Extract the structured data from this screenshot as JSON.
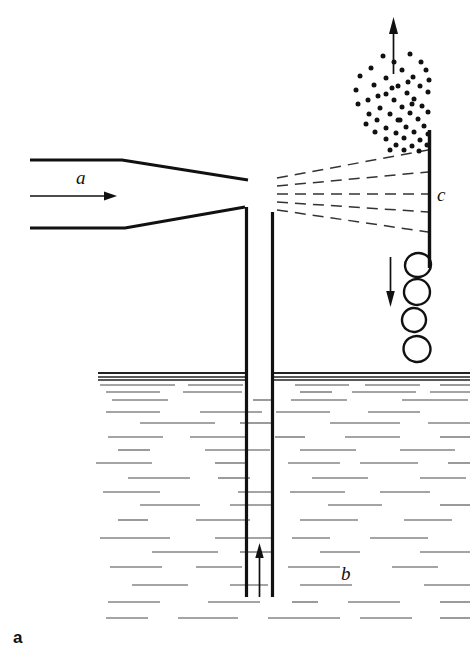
{
  "figure": {
    "caption_label": "a",
    "background_color": "#ffffff",
    "ink_color": "#111111",
    "water_line_color": "#4a4a4a",
    "width": 474,
    "height": 651
  },
  "labels": {
    "inlet": "a",
    "liquid": "b",
    "wall": "c"
  },
  "chart_data": {
    "type": "diagram",
    "title": "",
    "components": [
      {
        "name": "inlet-nozzle",
        "label": "a",
        "role": "converging gas/liquid inlet nozzle at upper left",
        "top_edge": [
          [
            30,
            160
          ],
          [
            122,
            160
          ],
          [
            248,
            180
          ]
        ],
        "bottom_edge": [
          [
            30,
            228
          ],
          [
            125,
            228
          ],
          [
            245,
            207
          ]
        ]
      },
      {
        "name": "inlet-flow-arrow",
        "role": "horizontal arrow indicating inflow direction",
        "from": [
          30,
          196
        ],
        "to": [
          110,
          196
        ]
      },
      {
        "name": "riser-tube",
        "role": "central vertical draft tube",
        "left_wall_x": 246,
        "right_wall_x": 272,
        "top_y_left": 207,
        "top_y_right": 212,
        "bottom_y": 597
      },
      {
        "name": "riser-flow-arrow",
        "role": "upward arrow inside riser tube showing liquid rise",
        "from": [
          259,
          597
        ],
        "to": [
          259,
          545
        ]
      },
      {
        "name": "spray-streaklines",
        "role": "dashed streak lines of the dispersed jet fanning toward the wall",
        "count": 5,
        "origin_x": 277,
        "target_x": 428,
        "origin_ys": [
          178,
          186,
          194,
          202,
          210
        ],
        "target_ys": [
          150,
          172,
          194,
          212,
          232
        ]
      },
      {
        "name": "droplet-spray-cloud",
        "role": "fine droplets / spray above the impingement region",
        "dot_count": 54,
        "bounds": [
          355,
          52,
          432,
          152
        ]
      },
      {
        "name": "exit-gas-arrow",
        "role": "upward arrow showing gas exit at top",
        "from": [
          393,
          72
        ],
        "to": [
          393,
          18
        ]
      },
      {
        "name": "wall-plate",
        "label": "c",
        "role": "vertical impingement wall / baffle on the right",
        "x": 429,
        "from_y": 130,
        "to_y": 268
      },
      {
        "name": "falling-film-arrow",
        "role": "downward arrow showing drainage along the wall",
        "from": [
          390,
          257
        ],
        "to": [
          390,
          306
        ]
      },
      {
        "name": "bubbles",
        "role": "coalesced drops/bubbles descending beside the wall",
        "count": 4,
        "positions": [
          [
            418,
            265
          ],
          [
            417,
            292
          ],
          [
            414,
            320
          ],
          [
            417,
            349
          ]
        ],
        "radii": [
          [
            13,
            12
          ],
          [
            13,
            13
          ],
          [
            12,
            12
          ],
          [
            13,
            13
          ]
        ]
      },
      {
        "name": "liquid-surface",
        "role": "free surface of the liquid pool",
        "line_ys": [
          373,
          377,
          380
        ],
        "from_x": 98,
        "to_x": 470
      },
      {
        "name": "liquid-pool",
        "label": "b",
        "role": "bulk liquid below the free surface, drawn as broken horizontal strokes",
        "top_y": 380,
        "bottom_y": 620
      }
    ],
    "annotations": [
      {
        "text": "a",
        "x": 83,
        "y": 183,
        "style": "italic",
        "refers_to": "inlet-nozzle"
      },
      {
        "text": "c",
        "x": 437,
        "y": 200,
        "style": "italic",
        "refers_to": "wall-plate"
      },
      {
        "text": "b",
        "x": 345,
        "y": 578,
        "style": "italic",
        "refers_to": "liquid-pool"
      },
      {
        "text": "a",
        "x": 14,
        "y": 641,
        "style": "bold-upright",
        "refers_to": "figure-panel-caption"
      }
    ]
  },
  "water_strokes": [
    {
      "y": 385,
      "segs": [
        [
          100,
          175
        ],
        [
          188,
          243
        ],
        [
          295,
          349
        ],
        [
          365,
          420
        ],
        [
          440,
          470
        ]
      ]
    },
    {
      "y": 392,
      "segs": [
        [
          106,
          160
        ],
        [
          183,
          242
        ],
        [
          300,
          332
        ],
        [
          352,
          416
        ],
        [
          430,
          470
        ]
      ]
    },
    {
      "y": 400,
      "segs": [
        [
          112,
          168
        ],
        [
          253,
          272
        ],
        [
          291,
          347
        ],
        [
          402,
          468
        ]
      ]
    },
    {
      "y": 412,
      "segs": [
        [
          106,
          160
        ],
        [
          200,
          262
        ],
        [
          276,
          330
        ],
        [
          368,
          420
        ]
      ]
    },
    {
      "y": 423,
      "segs": [
        [
          140,
          215
        ],
        [
          240,
          271
        ],
        [
          330,
          400
        ],
        [
          428,
          470
        ]
      ]
    },
    {
      "y": 437,
      "segs": [
        [
          108,
          163
        ],
        [
          190,
          248
        ],
        [
          275,
          305
        ],
        [
          345,
          400
        ],
        [
          440,
          470
        ]
      ]
    },
    {
      "y": 450,
      "segs": [
        [
          118,
          150
        ],
        [
          205,
          270
        ],
        [
          300,
          356
        ],
        [
          400,
          455
        ]
      ]
    },
    {
      "y": 463,
      "segs": [
        [
          96,
          152
        ],
        [
          215,
          245
        ],
        [
          288,
          340
        ],
        [
          360,
          418
        ],
        [
          448,
          470
        ]
      ]
    },
    {
      "y": 478,
      "segs": [
        [
          128,
          190
        ],
        [
          218,
          250
        ],
        [
          312,
          368
        ],
        [
          420,
          466
        ]
      ]
    },
    {
      "y": 492,
      "segs": [
        [
          103,
          160
        ],
        [
          238,
          272
        ],
        [
          290,
          345
        ],
        [
          380,
          430
        ]
      ]
    },
    {
      "y": 505,
      "segs": [
        [
          140,
          200
        ],
        [
          230,
          271
        ],
        [
          328,
          382
        ],
        [
          440,
          470
        ]
      ]
    },
    {
      "y": 520,
      "segs": [
        [
          118,
          148
        ],
        [
          196,
          250
        ],
        [
          300,
          358
        ],
        [
          404,
          452
        ]
      ]
    },
    {
      "y": 538,
      "segs": [
        [
          100,
          170
        ],
        [
          215,
          272
        ],
        [
          292,
          330
        ],
        [
          370,
          428
        ]
      ]
    },
    {
      "y": 552,
      "segs": [
        [
          152,
          218
        ],
        [
          240,
          271
        ],
        [
          320,
          360
        ],
        [
          420,
          470
        ]
      ]
    },
    {
      "y": 567,
      "segs": [
        [
          110,
          162
        ],
        [
          196,
          242
        ],
        [
          288,
          340
        ],
        [
          392,
          438
        ]
      ]
    },
    {
      "y": 585,
      "segs": [
        [
          132,
          188
        ],
        [
          230,
          268
        ],
        [
          300,
          352
        ],
        [
          424,
          470
        ]
      ]
    },
    {
      "y": 602,
      "segs": [
        [
          108,
          160
        ],
        [
          208,
          260
        ],
        [
          292,
          318
        ],
        [
          348,
          400
        ],
        [
          440,
          470
        ]
      ]
    },
    {
      "y": 618,
      "segs": [
        [
          106,
          148
        ],
        [
          178,
          238
        ],
        [
          268,
          340
        ],
        [
          360,
          412
        ],
        [
          440,
          470
        ]
      ]
    }
  ],
  "spray_dots": [
    [
      383,
      56
    ],
    [
      410,
      54
    ],
    [
      394,
      62
    ],
    [
      421,
      62
    ],
    [
      371,
      68
    ],
    [
      402,
      70
    ],
    [
      426,
      70
    ],
    [
      360,
      76
    ],
    [
      386,
      78
    ],
    [
      413,
      77
    ],
    [
      429,
      80
    ],
    [
      374,
      85
    ],
    [
      398,
      86
    ],
    [
      420,
      86
    ],
    [
      356,
      90
    ],
    [
      386,
      94
    ],
    [
      407,
      93
    ],
    [
      428,
      92
    ],
    [
      368,
      100
    ],
    [
      394,
      100
    ],
    [
      414,
      99
    ],
    [
      358,
      104
    ],
    [
      380,
      108
    ],
    [
      402,
      107
    ],
    [
      422,
      106
    ],
    [
      369,
      114
    ],
    [
      390,
      114
    ],
    [
      410,
      113
    ],
    [
      428,
      112
    ],
    [
      377,
      120
    ],
    [
      398,
      120
    ],
    [
      418,
      119
    ],
    [
      366,
      124
    ],
    [
      386,
      128
    ],
    [
      406,
      127
    ],
    [
      424,
      126
    ],
    [
      375,
      132
    ],
    [
      396,
      133
    ],
    [
      414,
      132
    ],
    [
      428,
      134
    ],
    [
      386,
      139
    ],
    [
      404,
      138
    ],
    [
      420,
      140
    ],
    [
      396,
      145
    ],
    [
      412,
      146
    ],
    [
      427,
      145
    ],
    [
      404,
      150
    ],
    [
      419,
      151
    ],
    [
      390,
      150
    ],
    [
      400,
      120
    ],
    [
      412,
      104
    ],
    [
      392,
      88
    ],
    [
      378,
      96
    ],
    [
      408,
      82
    ]
  ]
}
